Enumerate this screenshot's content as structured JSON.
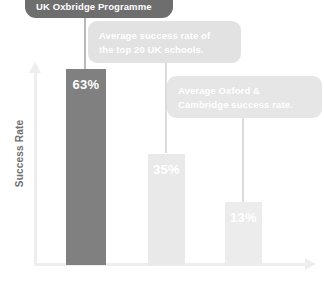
{
  "chart_data": {
    "type": "bar",
    "title": "UK Oxbridge Programme",
    "xlabel": "",
    "ylabel": "Success Rate",
    "ylim": [
      0,
      70
    ],
    "grid": false,
    "legend_position": "none",
    "categories": [
      "UK Oxbridge Programme",
      "Average success rate of the top 20 UK schools.",
      "Average Oxford & Cambridge success rate."
    ],
    "values": [
      63,
      35,
      13
    ],
    "value_labels": [
      "63%",
      "35%",
      "13%"
    ],
    "bar_colors": [
      "#808080",
      "#e9e9e9",
      "#ececec"
    ],
    "annotations": [
      "UK Oxbridge Programme",
      "Average success rate of the top 20 UK schools.",
      "Average Oxford & Cambridge success rate."
    ]
  },
  "axes": {
    "y_title": "Success Rate",
    "y_arrow_icon": "arrow-up-icon",
    "x_arrow_icon": "arrow-right-icon"
  },
  "callouts": [
    {
      "line1": "UK Oxbridge Programme",
      "line2": ""
    },
    {
      "line1": "Average success rate of",
      "line2": "the top 20 UK schools."
    },
    {
      "line1": "Average Oxford &",
      "line2": "Cambridge success rate."
    }
  ],
  "bars": [
    {
      "label": "63%",
      "value": 63
    },
    {
      "label": "35%",
      "value": 35
    },
    {
      "label": "13%",
      "value": 13
    }
  ],
  "colors": {
    "bar_primary": "#808080",
    "bar_secondary": "#e9e9e9",
    "bar_tertiary": "#ececec",
    "callout_dark": "#6e6e6e",
    "callout_light": "#e2e2e2",
    "axis": "#eeeeee",
    "text_axis": "#6f6f6f"
  }
}
